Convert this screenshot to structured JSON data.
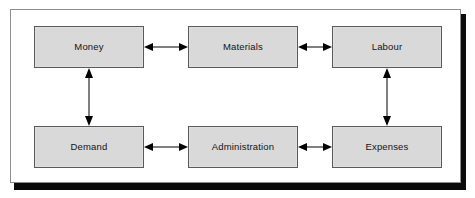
{
  "diagram": {
    "type": "block-diagram",
    "title": "",
    "background_color": "#ffffff",
    "frame": {
      "border_color": "#8e8e8e",
      "shadow_color": "#0b0b0b"
    },
    "node_style": {
      "fill_color": "#d9d9d9",
      "border_color": "#5a5a5a",
      "text_color": "#141414"
    },
    "arrow_style": {
      "color": "#000000",
      "kind": "double-headed"
    },
    "nodes": [
      {
        "id": "money",
        "label": "Money",
        "row": "top",
        "column": "left"
      },
      {
        "id": "materials",
        "label": "Materials",
        "row": "top",
        "column": "center"
      },
      {
        "id": "labour",
        "label": "Labour",
        "row": "top",
        "column": "right"
      },
      {
        "id": "demand",
        "label": "Demand",
        "row": "bottom",
        "column": "left"
      },
      {
        "id": "administration",
        "label": "Administration",
        "row": "bottom",
        "column": "center"
      },
      {
        "id": "expenses",
        "label": "Expenses",
        "row": "bottom",
        "column": "right"
      }
    ],
    "connections": [
      {
        "id": "money-materials",
        "from": "money",
        "to": "materials",
        "direction": "both",
        "orientation": "horizontal"
      },
      {
        "id": "materials-labour",
        "from": "materials",
        "to": "labour",
        "direction": "both",
        "orientation": "horizontal"
      },
      {
        "id": "money-demand",
        "from": "money",
        "to": "demand",
        "direction": "both",
        "orientation": "vertical"
      },
      {
        "id": "labour-expenses",
        "from": "labour",
        "to": "expenses",
        "direction": "both",
        "orientation": "vertical"
      },
      {
        "id": "demand-administration",
        "from": "demand",
        "to": "administration",
        "direction": "both",
        "orientation": "horizontal"
      },
      {
        "id": "administration-expenses",
        "from": "administration",
        "to": "expenses",
        "direction": "both",
        "orientation": "horizontal"
      }
    ]
  }
}
